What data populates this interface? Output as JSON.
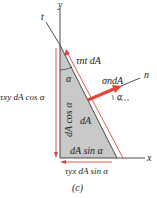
{
  "figure": {
    "caption": "(c)",
    "axes": {
      "y": "y",
      "t": "t",
      "n": "n",
      "x": "x"
    },
    "labels": {
      "tau_nt": "τnt dA",
      "sigma_n": "σndA",
      "alpha_top": "α",
      "alpha_right": "α",
      "dA": "dA",
      "vertical_side": "dA cos α",
      "bottom_side": "dA sin α",
      "tau_xy": "τxy dA cos α",
      "tau_yx": "τyx dA sin α"
    },
    "colors": {
      "element_fill": "#c9c9c9",
      "arrow": "#e0443a",
      "line": "#222222"
    }
  }
}
